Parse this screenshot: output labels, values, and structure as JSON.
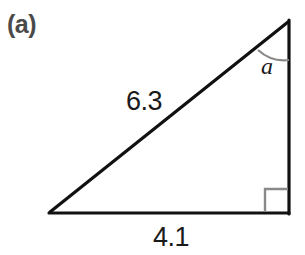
{
  "figure": {
    "panel_label": "(a)",
    "background_color": "#ffffff",
    "stroke_color": "#111111",
    "marker_color": "#8a8a8a",
    "label_color": "#1a1a1a",
    "panel_label_color": "#4a4a4a",
    "shape": "right-triangle",
    "vertices": {
      "apex": {
        "x": 289,
        "y": 21
      },
      "bottom_left": {
        "x": 49,
        "y": 213
      },
      "bottom_right": {
        "x": 289,
        "y": 213
      }
    },
    "sides": [
      {
        "name": "hypotenuse",
        "label": "6.3",
        "from": "bottom_left",
        "to": "apex"
      },
      {
        "name": "base",
        "label": "4.1",
        "from": "bottom_left",
        "to": "bottom_right"
      },
      {
        "name": "vertical",
        "label": "",
        "from": "bottom_right",
        "to": "apex"
      }
    ],
    "angles": [
      {
        "name": "apex-angle",
        "label": "a",
        "marker": "arc",
        "at": "apex"
      },
      {
        "name": "right-angle",
        "label": "",
        "marker": "square",
        "at": "bottom_right"
      }
    ]
  }
}
